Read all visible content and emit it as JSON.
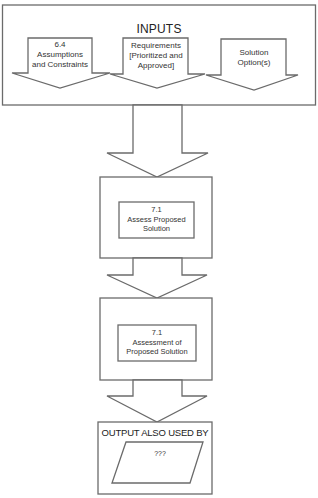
{
  "inputs": {
    "title": "INPUTS",
    "items": [
      {
        "line1": "6.4",
        "line2": "Assumptions",
        "line3": "and Constraints"
      },
      {
        "line1": "Requirements",
        "line2": "[Prioritized and",
        "line3": "Approved]"
      },
      {
        "line1": "Solution",
        "line2": "Option(s)",
        "line3": ""
      }
    ]
  },
  "task": {
    "number": "7.1",
    "line2": "Assess Proposed",
    "line3": "Solution"
  },
  "output": {
    "number": "7.1",
    "line2": "Assessment of",
    "line3": "Proposed Solution"
  },
  "used_by": {
    "title": "OUTPUT ALSO USED BY",
    "item": "???"
  },
  "colors": {
    "stroke": "#6b6b6b",
    "background": "#ffffff"
  }
}
